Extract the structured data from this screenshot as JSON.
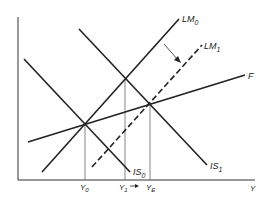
{
  "diagram": {
    "type": "IS-LM-F economic diagram",
    "axes": {
      "x_label": "Y",
      "y_label": ""
    },
    "curves": [
      {
        "id": "LM0",
        "label": "LM",
        "subscript": "0",
        "style": "solid"
      },
      {
        "id": "LM1",
        "label": "LM",
        "subscript": "1",
        "style": "dashed"
      },
      {
        "id": "F",
        "label": "F",
        "subscript": "",
        "style": "solid"
      },
      {
        "id": "IS0",
        "label": "IS",
        "subscript": "0",
        "style": "solid"
      },
      {
        "id": "IS1",
        "label": "IS",
        "subscript": "1",
        "style": "solid"
      }
    ],
    "x_ticks": [
      {
        "id": "Y0",
        "label": "Y",
        "subscript": "0"
      },
      {
        "id": "Y1",
        "label": "Y",
        "subscript": "1",
        "arrow": "→"
      },
      {
        "id": "YE",
        "label": "Y",
        "subscript": "E"
      }
    ],
    "colors": {
      "line": "#222222",
      "guide": "#555555",
      "background": "#ffffff"
    }
  }
}
